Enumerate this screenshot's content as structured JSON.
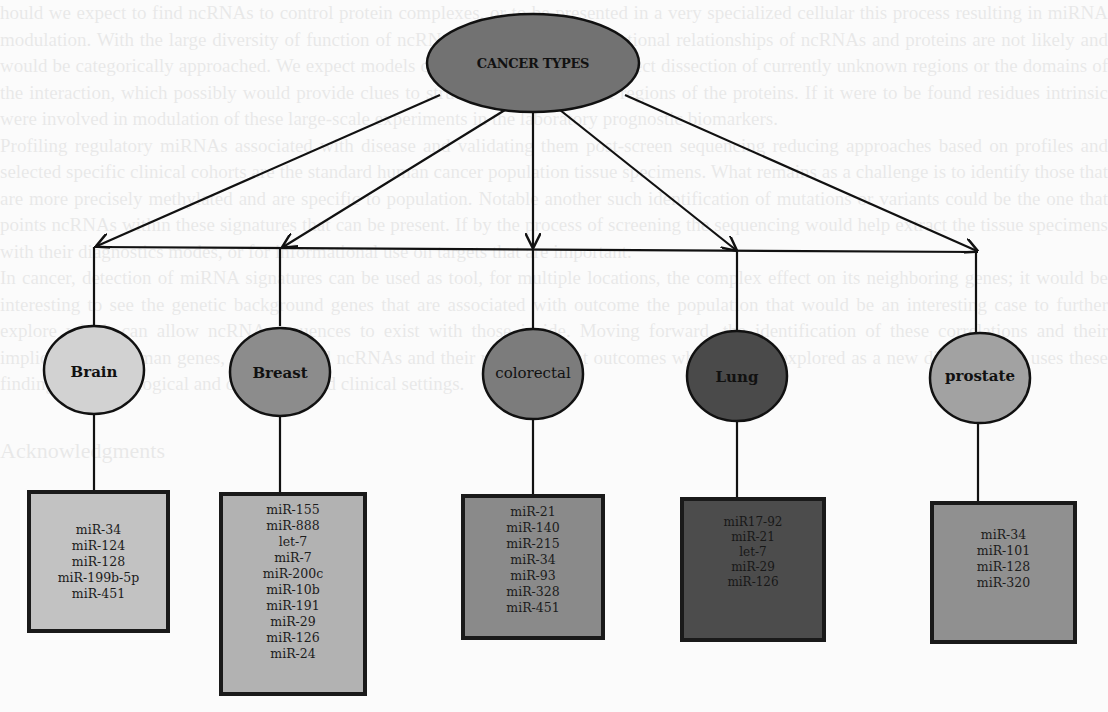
{
  "diagram": {
    "title": "CANCER TYPES",
    "root": {
      "label": "CANCER TYPES",
      "color": "#727272"
    },
    "categories": [
      {
        "label": "Brain",
        "circle_color": "#d2d2d2",
        "box_color": "#c2c2c2",
        "mirnas": [
          "miR-34",
          "miR-124",
          "miR-128",
          "miR-199b-5p",
          "miR-451"
        ]
      },
      {
        "label": "Breast",
        "circle_color": "#8c8c8c",
        "box_color": "#b2b2b2",
        "mirnas": [
          "miR-155",
          "miR-888",
          "let-7",
          "miR-7",
          "miR-200c",
          "miR-10b",
          "miR-191",
          "miR-29",
          "miR-126",
          "miR-24"
        ]
      },
      {
        "label": "colorectal",
        "circle_color": "#7c7c7c",
        "box_color": "#8a8a8a",
        "mirnas": [
          "miR-21",
          "miR-140",
          "miR-215",
          "miR-34",
          "miR-93",
          "miR-328",
          "miR-451"
        ]
      },
      {
        "label": "Lung",
        "circle_color": "#4a4a4a",
        "box_color": "#4c4c4c",
        "mirnas": [
          "miR17-92",
          "miR-21",
          "let-7",
          "miR-29",
          "miR-126"
        ]
      },
      {
        "label": "prostate",
        "circle_color": "#a2a2a2",
        "box_color": "#909090",
        "mirnas": [
          "miR-34",
          "miR-101",
          "miR-128",
          "miR-320"
        ]
      }
    ]
  },
  "background_text": {
    "paragraphs": [
      "hould we expect to find ncRNAs to control protein complexes, or to be presented in a very specialized cellular this process resulting in miRNA modulation. With the large diversity of function of ncRNAs, exhaustive gen functional relationships of ncRNAs and proteins are not likely and would be categorically approached. We expect models of ncRNAs might be the direct dissection of currently unknown regions or the domains of the interaction, which possibly would provide clues to structural and functional regions of the proteins. If it were to be found residues intrinsic were involved in modulation of these large-scale experiments in the laboratory prognostic biomarkers.",
      "Profiling regulatory miRNAs associated with disease and validating them post-screen sequencing reducing approaches based on profiles and selected specific clinical cohorts are the standard human cancer population tissue specimens. What remains as a challenge is to identify those that are more precisely methylated and are specific to population. Notable another such identification of mutations or variants could be the one that points ncRNAs within these signatures that can be present. If by the process of screening the sequencing would help extract the tissue specimens with their diagnostics modes, or for informational use on targets that are important.",
      "In cancer, detection of miRNA signatures can be used as tool, for multiple locations, the complex effect on its neighboring genes; it would be interesting to see the genetic background genes that are associated with outcome the population that would be an interesting case to further explore which can allow ncRNA sequences to exist with those inside. Moving forward, the identification of these correlations and their implications to human genes, miRNAs and ncRNAs and their role in patient outcomes which can be explored as a new direction that uses these findings in technological and diagnostic and clinical settings."
    ],
    "heading": "Acknowledgments"
  }
}
